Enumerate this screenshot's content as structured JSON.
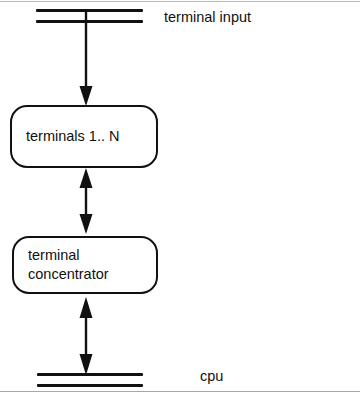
{
  "diagram": {
    "background_color": "#ffffff",
    "line_color": "#111111",
    "buses": [
      {
        "id": "terminal-input-bus",
        "label": "terminal input",
        "bar_count": 2
      },
      {
        "id": "cpu-bus",
        "label": "cpu",
        "bar_count": 2
      }
    ],
    "nodes": [
      {
        "id": "terminals",
        "label": "terminals 1.. N"
      },
      {
        "id": "concentrator",
        "label": "terminal\nconcentrator"
      }
    ],
    "connectors": [
      {
        "id": "input-to-terminals",
        "from": "terminal-input-bus",
        "to": "terminals",
        "arrowheads": "single-down"
      },
      {
        "id": "terminals-to-concentrator",
        "from": "terminals",
        "to": "concentrator",
        "arrowheads": "double"
      },
      {
        "id": "concentrator-to-cpu",
        "from": "concentrator",
        "to": "cpu-bus",
        "arrowheads": "double"
      }
    ],
    "captions": {
      "terminal_input": "terminal input",
      "cpu": "cpu"
    }
  }
}
